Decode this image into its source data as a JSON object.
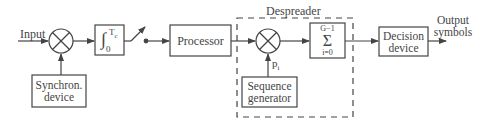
{
  "diagram": {
    "colors": {
      "stroke": "#444444",
      "text": "#444444",
      "background": "#ffffff"
    },
    "labels": {
      "input": "Input",
      "output_line1": "Output",
      "output_line2": "symbols",
      "despreader": "Despreader",
      "pi": "p",
      "pi_sub": "i"
    },
    "blocks": {
      "synchron": {
        "line1": "Synchron.",
        "line2": "device"
      },
      "integrator": {
        "symbol": "∫",
        "upper": "T",
        "upper_sub": "c",
        "lower": "0"
      },
      "processor": {
        "label": "Processor"
      },
      "sequence_generator": {
        "line1": "Sequence",
        "line2": "generator"
      },
      "summation": {
        "upper": "G−1",
        "symbol": "Σ",
        "lower": "i=0"
      },
      "decision": {
        "line1": "Decision",
        "line2": "device"
      }
    },
    "nodes": [
      {
        "id": "multiplier-1",
        "type": "multiplier"
      },
      {
        "id": "switch",
        "type": "switch"
      },
      {
        "id": "multiplier-2",
        "type": "multiplier"
      }
    ]
  }
}
